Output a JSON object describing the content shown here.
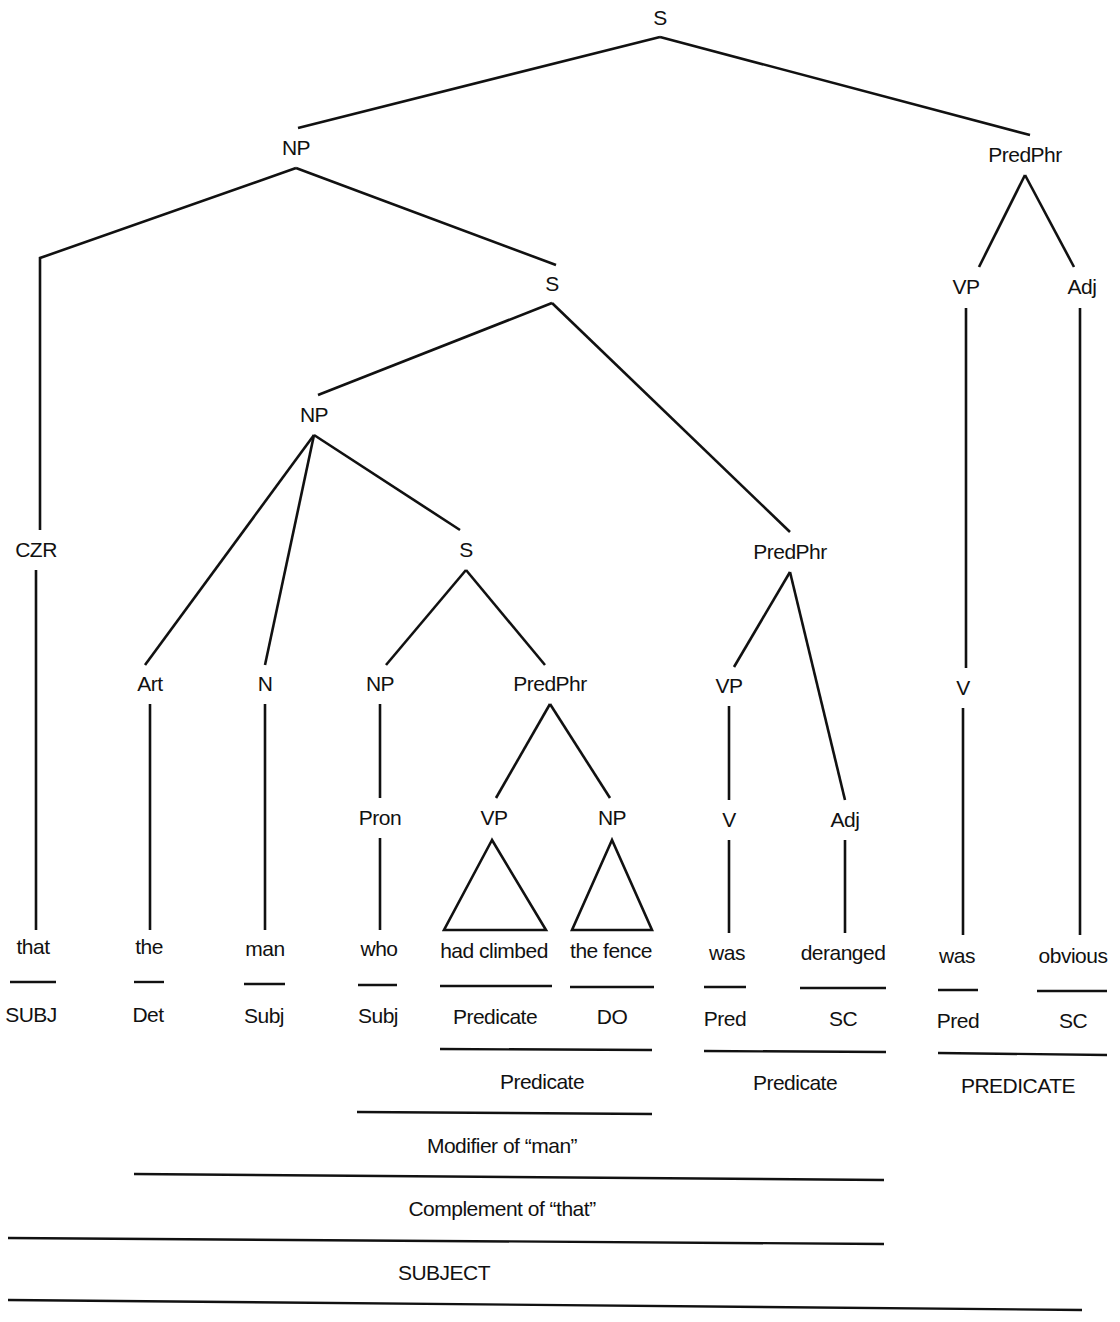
{
  "diagram": {
    "type": "syntax-tree",
    "nodes": [
      {
        "id": "S0",
        "label": "S",
        "x": 660,
        "y": 18
      },
      {
        "id": "NP1",
        "label": "NP",
        "x": 296,
        "y": 148
      },
      {
        "id": "PP1",
        "label": "PredPhr",
        "x": 1025,
        "y": 155
      },
      {
        "id": "S1",
        "label": "S",
        "x": 552,
        "y": 284
      },
      {
        "id": "VP1",
        "label": "VP",
        "x": 966,
        "y": 287
      },
      {
        "id": "Adj1",
        "label": "Adj",
        "x": 1082,
        "y": 287
      },
      {
        "id": "NP2",
        "label": "NP",
        "x": 314,
        "y": 415
      },
      {
        "id": "CZR",
        "label": "CZR",
        "x": 36,
        "y": 550
      },
      {
        "id": "S2",
        "label": "S",
        "x": 466,
        "y": 550
      },
      {
        "id": "PP2",
        "label": "PredPhr",
        "x": 790,
        "y": 552
      },
      {
        "id": "Art",
        "label": "Art",
        "x": 150,
        "y": 684
      },
      {
        "id": "N",
        "label": "N",
        "x": 265,
        "y": 684
      },
      {
        "id": "NP3",
        "label": "NP",
        "x": 380,
        "y": 684
      },
      {
        "id": "PP3",
        "label": "PredPhr",
        "x": 550,
        "y": 684
      },
      {
        "id": "VP2",
        "label": "VP",
        "x": 729,
        "y": 686
      },
      {
        "id": "V1",
        "label": "V",
        "x": 963,
        "y": 688
      },
      {
        "id": "Pron",
        "label": "Pron",
        "x": 380,
        "y": 818
      },
      {
        "id": "VP3",
        "label": "VP",
        "x": 494,
        "y": 818
      },
      {
        "id": "NP4",
        "label": "NP",
        "x": 612,
        "y": 818
      },
      {
        "id": "V2",
        "label": "V",
        "x": 729,
        "y": 820
      },
      {
        "id": "Adj2",
        "label": "Adj",
        "x": 845,
        "y": 820
      }
    ],
    "words": [
      {
        "text": "that",
        "x": 33,
        "y": 947
      },
      {
        "text": "the",
        "x": 149,
        "y": 947
      },
      {
        "text": "man",
        "x": 265,
        "y": 949
      },
      {
        "text": "who",
        "x": 379,
        "y": 949
      },
      {
        "text": "had climbed",
        "x": 494,
        "y": 951
      },
      {
        "text": "the fence",
        "x": 611,
        "y": 951
      },
      {
        "text": "was",
        "x": 727,
        "y": 953
      },
      {
        "text": "deranged",
        "x": 843,
        "y": 953
      },
      {
        "text": "was",
        "x": 957,
        "y": 956
      },
      {
        "text": "obvious",
        "x": 1073,
        "y": 956
      }
    ],
    "functions": [
      {
        "text": "SUBJ",
        "x": 31,
        "y": 1015
      },
      {
        "text": "Det",
        "x": 148,
        "y": 1015
      },
      {
        "text": "Subj",
        "x": 264,
        "y": 1016
      },
      {
        "text": "Subj",
        "x": 378,
        "y": 1016
      },
      {
        "text": "Predicate",
        "x": 495,
        "y": 1017
      },
      {
        "text": "DO",
        "x": 612,
        "y": 1017
      },
      {
        "text": "Pred",
        "x": 725,
        "y": 1019
      },
      {
        "text": "SC",
        "x": 843,
        "y": 1019
      },
      {
        "text": "Pred",
        "x": 958,
        "y": 1021
      },
      {
        "text": "SC",
        "x": 1073,
        "y": 1021
      }
    ],
    "groupings": [
      {
        "text": "Predicate",
        "x": 542,
        "y": 1082
      },
      {
        "text": "Predicate",
        "x": 795,
        "y": 1083
      },
      {
        "text": "PREDICATE",
        "x": 1018,
        "y": 1086
      },
      {
        "text": "Modifier of “man”",
        "x": 502,
        "y": 1146
      },
      {
        "text": "Complement of “that”",
        "x": 502,
        "y": 1209
      },
      {
        "text": "SUBJECT",
        "x": 444,
        "y": 1273
      }
    ]
  }
}
